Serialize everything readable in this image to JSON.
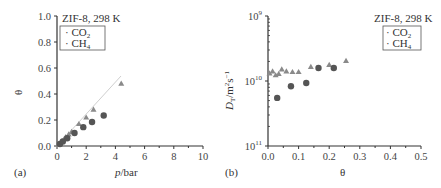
{
  "chart_data": [
    {
      "panel": "(a)",
      "type": "scatter",
      "title": "ZIF-8, 298 K",
      "xlabel": "p/bar",
      "ylabel": "θ",
      "xlim": [
        0,
        10
      ],
      "ylim": [
        0,
        1.0
      ],
      "xticks": [
        "0",
        "2",
        "4",
        "6",
        "8",
        "10"
      ],
      "yticks": [
        "0.0",
        "0.2",
        "0.4",
        "0.6",
        "0.8",
        "1.0"
      ],
      "legend": {
        "position": "upper-left",
        "entries": [
          "CO2",
          "CH4"
        ]
      },
      "series": [
        {
          "name": "CO2",
          "marker": "triangle",
          "color": "#8a8a8a",
          "x": [
            0.1,
            0.2,
            0.3,
            0.5,
            0.6,
            0.8,
            1.0,
            1.5,
            2.0,
            2.5,
            4.4
          ],
          "y": [
            0.01,
            0.02,
            0.035,
            0.055,
            0.07,
            0.09,
            0.11,
            0.17,
            0.22,
            0.28,
            0.48
          ]
        },
        {
          "name": "CH4",
          "marker": "circle",
          "color": "#555555",
          "x": [
            0.2,
            0.4,
            0.7,
            1.2,
            1.8,
            2.4,
            3.2
          ],
          "y": [
            0.015,
            0.035,
            0.06,
            0.1,
            0.145,
            0.185,
            0.235
          ]
        }
      ],
      "fit_line": {
        "x": [
          0,
          4.4
        ],
        "y": [
          0,
          0.48
        ]
      }
    },
    {
      "panel": "(b)",
      "type": "scatter",
      "title": "ZIF-8, 298 K",
      "xlabel": "θ",
      "ylabel": "D_T/m^2 s^-1",
      "xlim": [
        0,
        0.5
      ],
      "yscale": "log",
      "yticks": [
        "10^9",
        "10^10",
        "10^11"
      ],
      "xticks": [
        "0.0",
        "0.1",
        "0.2",
        "0.3",
        "0.4",
        "0.5"
      ],
      "legend": {
        "position": "upper-right",
        "entries": [
          "CO2",
          "CH4"
        ]
      },
      "series": [
        {
          "name": "CO2",
          "marker": "triangle",
          "color": "#8a8a8a",
          "x": [
            0.005,
            0.015,
            0.025,
            0.035,
            0.045,
            0.06,
            0.08,
            0.1,
            0.14,
            0.2,
            0.255
          ],
          "y_exponent": [
            9.88,
            9.85,
            9.91,
            9.89,
            9.82,
            9.85,
            9.86,
            9.86,
            9.78,
            9.75,
            9.69
          ]
        },
        {
          "name": "CH4",
          "marker": "circle",
          "color": "#555555",
          "x": [
            0.03,
            0.075,
            0.125,
            0.165,
            0.215
          ],
          "y_exponent": [
            10.26,
            10.08,
            10.03,
            9.8,
            9.8
          ]
        }
      ]
    }
  ],
  "panels": {
    "a": {
      "label": "(a)",
      "title": "ZIF-8, 298 K",
      "legend_co2": "CO",
      "legend_co2_sub": "2",
      "legend_ch4": "CH",
      "legend_ch4_sub": "4",
      "xlabel_italic": "p",
      "xlabel_rest": "/bar",
      "ylabel": "θ"
    },
    "b": {
      "label": "(b)",
      "title": "ZIF-8, 298 K",
      "legend_co2": "CO",
      "legend_co2_sub": "2",
      "legend_ch4": "CH",
      "legend_ch4_sub": "4",
      "xlabel": "θ",
      "ylabel_D": "D",
      "ylabel_sub": "T",
      "ylabel_rest": "/m",
      "ylabel_sup": "2",
      "ylabel_s": "s",
      "ylabel_sup2": "−1"
    }
  }
}
